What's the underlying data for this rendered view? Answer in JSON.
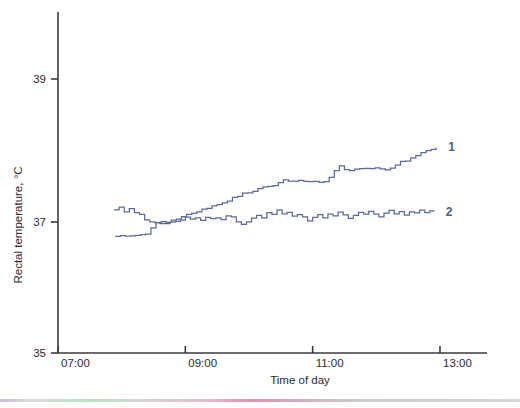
{
  "chart_data": {
    "type": "line",
    "title": "",
    "xlabel": "Time of day",
    "ylabel": "Rectal temperature, °C",
    "xlim": [
      7.0,
      13.4
    ],
    "ylim": [
      35,
      39.6
    ],
    "grid": false,
    "legend_position": "inline-right",
    "x_ticks": [
      "07:00",
      "09:00",
      "11:00",
      "13:00"
    ],
    "x_tick_values": [
      7,
      9,
      11,
      13
    ],
    "y_ticks": [
      "35",
      "37",
      "39"
    ],
    "y_tick_values": [
      35,
      37,
      39
    ],
    "line_color": "#5b6a9c",
    "series": [
      {
        "name": "1",
        "label": "1",
        "x": [
          7.9,
          7.98,
          8.06,
          8.14,
          8.22,
          8.3,
          8.38,
          8.46,
          8.54,
          8.62,
          8.7,
          8.78,
          8.86,
          8.94,
          9.02,
          9.1,
          9.18,
          9.26,
          9.34,
          9.42,
          9.5,
          9.58,
          9.66,
          9.74,
          9.82,
          9.9,
          9.98,
          10.06,
          10.14,
          10.22,
          10.3,
          10.38,
          10.46,
          10.54,
          10.62,
          10.7,
          10.78,
          10.86,
          10.94,
          11.02,
          11.1,
          11.18,
          11.26,
          11.34,
          11.42,
          11.5,
          11.58,
          11.66,
          11.74,
          11.82,
          11.9,
          11.98,
          12.06,
          12.14,
          12.22,
          12.3,
          12.38,
          12.46,
          12.54,
          12.62,
          12.7,
          12.78,
          12.86,
          12.94
        ],
        "y": [
          36.78,
          36.78,
          36.78,
          36.78,
          36.79,
          36.8,
          36.82,
          36.9,
          36.98,
          37.0,
          37.0,
          37.02,
          37.04,
          37.08,
          37.1,
          37.12,
          37.14,
          37.18,
          37.2,
          37.22,
          37.24,
          37.26,
          37.3,
          37.34,
          37.36,
          37.4,
          37.41,
          37.43,
          37.46,
          37.5,
          37.5,
          37.52,
          37.55,
          37.58,
          37.58,
          37.58,
          37.58,
          37.57,
          37.56,
          37.56,
          37.55,
          37.56,
          37.62,
          37.72,
          37.78,
          37.74,
          37.72,
          37.74,
          37.75,
          37.74,
          37.75,
          37.76,
          37.74,
          37.72,
          37.76,
          37.8,
          37.84,
          37.86,
          37.9,
          37.92,
          37.96,
          38.0,
          38.02,
          38.05
        ]
      },
      {
        "name": "2",
        "label": "2",
        "x": [
          7.88,
          7.96,
          8.04,
          8.12,
          8.2,
          8.28,
          8.36,
          8.44,
          8.52,
          8.6,
          8.68,
          8.76,
          8.84,
          8.92,
          9.0,
          9.08,
          9.16,
          9.24,
          9.32,
          9.4,
          9.48,
          9.56,
          9.64,
          9.72,
          9.8,
          9.88,
          9.96,
          10.04,
          10.12,
          10.2,
          10.28,
          10.36,
          10.44,
          10.52,
          10.6,
          10.68,
          10.76,
          10.84,
          10.92,
          11.0,
          11.08,
          11.16,
          11.24,
          11.32,
          11.4,
          11.48,
          11.56,
          11.64,
          11.72,
          11.8,
          11.88,
          11.96,
          12.04,
          12.12,
          12.2,
          12.28,
          12.36,
          12.44,
          12.52,
          12.6,
          12.68,
          12.76,
          12.84,
          12.9
        ],
        "y": [
          37.16,
          37.2,
          37.14,
          37.18,
          37.12,
          37.1,
          37.04,
          37.0,
          36.98,
          36.98,
          36.98,
          36.99,
          37.0,
          37.02,
          37.06,
          37.04,
          37.06,
          37.02,
          37.06,
          37.04,
          37.05,
          37.04,
          37.08,
          37.06,
          37.0,
          36.96,
          37.0,
          37.06,
          37.1,
          37.06,
          37.12,
          37.1,
          37.16,
          37.12,
          37.14,
          37.08,
          37.1,
          37.06,
          37.02,
          37.06,
          37.1,
          37.06,
          37.12,
          37.08,
          37.14,
          37.1,
          37.06,
          37.1,
          37.14,
          37.1,
          37.16,
          37.12,
          37.08,
          37.12,
          37.16,
          37.12,
          37.14,
          37.1,
          37.14,
          37.12,
          37.16,
          37.14,
          37.16,
          37.14
        ]
      }
    ]
  }
}
